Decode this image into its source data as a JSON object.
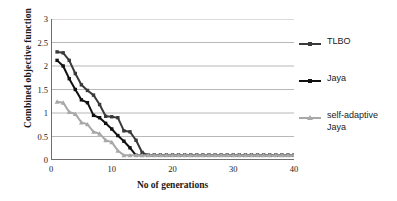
{
  "chart_data": {
    "type": "line",
    "title": "",
    "xlabel": "No of generations",
    "ylabel": "Combined objective function",
    "xlim": [
      0,
      40
    ],
    "ylim": [
      0,
      3
    ],
    "xticks": [
      0,
      10,
      20,
      30,
      40
    ],
    "yticks": [
      0,
      0.5,
      1,
      1.5,
      2,
      2.5,
      3
    ],
    "grid": "horizontal",
    "legend_position": "right",
    "x": [
      1,
      2,
      3,
      4,
      5,
      6,
      7,
      8,
      9,
      10,
      11,
      12,
      13,
      14,
      15,
      16,
      17,
      18,
      19,
      20,
      21,
      22,
      23,
      24,
      25,
      26,
      27,
      28,
      29,
      30,
      31,
      32,
      33,
      34,
      35,
      36,
      37,
      38,
      39,
      40
    ],
    "series": [
      {
        "name": "TLBO",
        "color": "#3a3a3a",
        "marker": "square",
        "values": [
          2.3,
          2.28,
          2.12,
          1.84,
          1.6,
          1.48,
          1.38,
          1.18,
          0.93,
          0.92,
          0.9,
          0.62,
          0.6,
          0.42,
          0.16,
          0.1,
          0.1,
          0.1,
          0.1,
          0.1,
          0.1,
          0.1,
          0.1,
          0.1,
          0.1,
          0.1,
          0.1,
          0.1,
          0.1,
          0.1,
          0.1,
          0.1,
          0.1,
          0.1,
          0.1,
          0.1,
          0.1,
          0.1,
          0.1,
          0.1
        ]
      },
      {
        "name": "Jaya",
        "color": "#111111",
        "marker": "square",
        "values": [
          2.12,
          2.0,
          1.73,
          1.5,
          1.28,
          1.22,
          0.95,
          0.9,
          0.78,
          0.66,
          0.52,
          0.4,
          0.26,
          0.1,
          0.1,
          0.1,
          0.1,
          0.1,
          0.1,
          0.1,
          0.1,
          0.1,
          0.1,
          0.1,
          0.1,
          0.1,
          0.1,
          0.1,
          0.1,
          0.1,
          0.1,
          0.1,
          0.1,
          0.1,
          0.1,
          0.1,
          0.1,
          0.1,
          0.1,
          0.1
        ]
      },
      {
        "name": "self-adaptive\nJaya",
        "color": "#a8a8a8",
        "marker": "triangle",
        "values": [
          1.24,
          1.22,
          1.02,
          0.98,
          0.8,
          0.76,
          0.6,
          0.56,
          0.42,
          0.38,
          0.2,
          0.1,
          0.1,
          0.1,
          0.1,
          0.1,
          0.1,
          0.1,
          0.1,
          0.1,
          0.1,
          0.1,
          0.1,
          0.1,
          0.1,
          0.1,
          0.1,
          0.1,
          0.1,
          0.1,
          0.1,
          0.1,
          0.1,
          0.1,
          0.1,
          0.1,
          0.1,
          0.1,
          0.1,
          0.1
        ]
      }
    ]
  },
  "legend": {
    "items": [
      {
        "label": "TLBO"
      },
      {
        "label": "Jaya"
      },
      {
        "label": "self-adaptive\nJaya"
      }
    ]
  },
  "axes": {
    "y_title": "Combined objective function",
    "x_title": "No of generations",
    "y_tick_labels": [
      "0",
      "0.5",
      "1",
      "1.5",
      "2",
      "2.5",
      "3"
    ],
    "x_tick_labels": [
      "0",
      "10",
      "20",
      "30",
      "40"
    ]
  },
  "colors": {
    "grid": "#9a9a9a",
    "axis": "#6f6f6f",
    "text": "#1a1a1a",
    "background": "#ffffff"
  }
}
